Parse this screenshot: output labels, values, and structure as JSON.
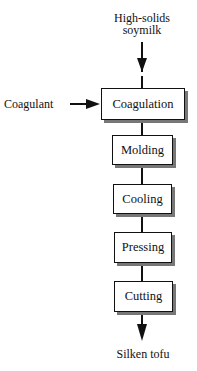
{
  "diagram": {
    "type": "process-flowchart",
    "input_top": {
      "line1": "High-solids",
      "line2": "soymilk"
    },
    "side_input": "Coagulant",
    "steps": [
      {
        "label": "Coagulation"
      },
      {
        "label": "Molding"
      },
      {
        "label": "Cooling"
      },
      {
        "label": "Pressing"
      },
      {
        "label": "Cutting"
      }
    ],
    "output": "Silken tofu",
    "colors": {
      "line": "#111111",
      "shadow": "#777777",
      "background": "#ffffff"
    }
  }
}
